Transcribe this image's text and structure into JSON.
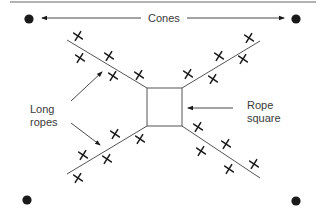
{
  "diagram": {
    "title": "",
    "labels": {
      "cones": "Cones",
      "long_ropes_line1": "Long",
      "long_ropes_line2": "ropes",
      "rope_square_line1": "Rope",
      "rope_square_line2": "square"
    },
    "colors": {
      "ink": "#1a1a1a",
      "line": "#555555",
      "top_rule": "#999999",
      "text": "#3a3a3a",
      "background": "#ffffff"
    },
    "cones": [
      {
        "id": "cone-top-left",
        "x": 29,
        "y": 19
      },
      {
        "id": "cone-top-right",
        "x": 296,
        "y": 19
      },
      {
        "id": "cone-bottom-left",
        "x": 27,
        "y": 200
      },
      {
        "id": "cone-bottom-right",
        "x": 296,
        "y": 201
      }
    ],
    "rope_square": {
      "x": 147,
      "y": 88,
      "width": 35,
      "height": 38
    },
    "long_ropes": [
      {
        "id": "rope-top-left",
        "x1": 67,
        "y1": 40,
        "x2": 147,
        "y2": 88
      },
      {
        "id": "rope-top-right",
        "x1": 182,
        "y1": 88,
        "x2": 260,
        "y2": 41
      },
      {
        "id": "rope-bottom-left",
        "x1": 67,
        "y1": 174,
        "x2": 147,
        "y2": 126
      },
      {
        "id": "rope-bottom-right",
        "x1": 182,
        "y1": 126,
        "x2": 260,
        "y2": 178
      }
    ],
    "player_marks": [
      {
        "x": 78,
        "y": 36
      },
      {
        "x": 80,
        "y": 58
      },
      {
        "x": 109,
        "y": 56
      },
      {
        "x": 113,
        "y": 76
      },
      {
        "x": 139,
        "y": 75
      },
      {
        "x": 188,
        "y": 74
      },
      {
        "x": 213,
        "y": 79
      },
      {
        "x": 219,
        "y": 56
      },
      {
        "x": 243,
        "y": 59
      },
      {
        "x": 249,
        "y": 38
      },
      {
        "x": 78,
        "y": 178
      },
      {
        "x": 83,
        "y": 155
      },
      {
        "x": 107,
        "y": 159
      },
      {
        "x": 115,
        "y": 134
      },
      {
        "x": 140,
        "y": 139
      },
      {
        "x": 198,
        "y": 127
      },
      {
        "x": 201,
        "y": 151
      },
      {
        "x": 226,
        "y": 144
      },
      {
        "x": 229,
        "y": 169
      },
      {
        "x": 254,
        "y": 164
      }
    ],
    "player_mark_symbol": "X"
  }
}
